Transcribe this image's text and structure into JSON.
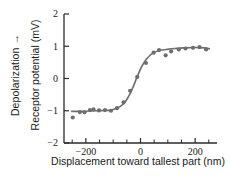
{
  "chart_data": {
    "type": "scatter",
    "title": "",
    "xlabel": "Displacement toward tallest part (nm)",
    "ylabel": "Receptor potential (mV)",
    "axis_annotation": "Depolarization →",
    "xlim": [
      -280,
      280
    ],
    "ylim": [
      -2,
      2
    ],
    "grid": false,
    "legend": "none",
    "xticks": [
      -200,
      0,
      200
    ],
    "xtick_labels": [
      "−200",
      "0",
      "200"
    ],
    "xminor_ticks": [
      -250,
      -150,
      -100,
      -50,
      50,
      100,
      150,
      250
    ],
    "yticks": [
      -2,
      -1,
      0,
      1,
      2
    ],
    "ytick_labels": [
      "−2",
      "−1",
      "0",
      "1",
      "2"
    ],
    "marker_color": "#6e6e6e",
    "line_color": "#6e6e6e",
    "axis_color": "#2a2a2a",
    "points": [
      {
        "x": -248,
        "y": -1.21
      },
      {
        "x": -222,
        "y": -1.04
      },
      {
        "x": -205,
        "y": -1.05
      },
      {
        "x": -185,
        "y": -0.98
      },
      {
        "x": -172,
        "y": -0.96
      },
      {
        "x": -152,
        "y": -0.99
      },
      {
        "x": -130,
        "y": -0.98
      },
      {
        "x": -108,
        "y": -1.0
      },
      {
        "x": -86,
        "y": -0.92
      },
      {
        "x": -62,
        "y": -0.74
      },
      {
        "x": -38,
        "y": -0.38
      },
      {
        "x": -12,
        "y": 0.05
      },
      {
        "x": 20,
        "y": 0.48
      },
      {
        "x": 48,
        "y": 0.8
      },
      {
        "x": 68,
        "y": 0.88
      },
      {
        "x": 92,
        "y": 0.72
      },
      {
        "x": 112,
        "y": 0.84
      },
      {
        "x": 140,
        "y": 0.9
      },
      {
        "x": 165,
        "y": 0.93
      },
      {
        "x": 192,
        "y": 0.95
      },
      {
        "x": 216,
        "y": 0.97
      },
      {
        "x": 240,
        "y": 0.9
      }
    ],
    "fit_curve": [
      {
        "x": -252,
        "y": -1.02
      },
      {
        "x": -220,
        "y": -1.02
      },
      {
        "x": -190,
        "y": -1.01
      },
      {
        "x": -160,
        "y": -1.0
      },
      {
        "x": -130,
        "y": -0.99
      },
      {
        "x": -110,
        "y": -0.98
      },
      {
        "x": -90,
        "y": -0.93
      },
      {
        "x": -70,
        "y": -0.84
      },
      {
        "x": -55,
        "y": -0.71
      },
      {
        "x": -40,
        "y": -0.5
      },
      {
        "x": -25,
        "y": -0.22
      },
      {
        "x": -10,
        "y": 0.1
      },
      {
        "x": 5,
        "y": 0.38
      },
      {
        "x": 20,
        "y": 0.58
      },
      {
        "x": 35,
        "y": 0.72
      },
      {
        "x": 50,
        "y": 0.81
      },
      {
        "x": 70,
        "y": 0.87
      },
      {
        "x": 95,
        "y": 0.9
      },
      {
        "x": 125,
        "y": 0.93
      },
      {
        "x": 160,
        "y": 0.95
      },
      {
        "x": 200,
        "y": 0.96
      },
      {
        "x": 235,
        "y": 0.95
      },
      {
        "x": 252,
        "y": 0.92
      }
    ]
  }
}
